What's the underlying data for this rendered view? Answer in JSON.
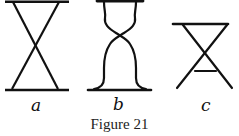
{
  "figure": {
    "caption": "Figure 21",
    "panels": [
      {
        "label": "a",
        "description": "hourglass of two straight crossed lines between top and bottom bars"
      },
      {
        "label": "b",
        "description": "hourglass with curved sides between narrow top bar and wider bottom bar"
      },
      {
        "label": "c",
        "description": "crossed lines under a top bar with a short crossbar below the crossing"
      }
    ]
  },
  "colors": {
    "ink": "#111111",
    "background": "#ffffff"
  }
}
